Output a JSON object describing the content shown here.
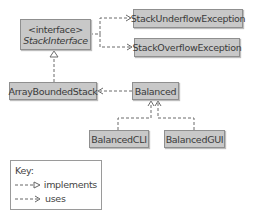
{
  "diagram": {
    "nodes": {
      "stack_interface": {
        "stereotype": "<interface>",
        "name": "StackInterface"
      },
      "stack_underflow": {
        "name": "StackUnderflowException"
      },
      "stack_overflow": {
        "name": "StackOverflowException"
      },
      "array_bounded_stack": {
        "name": "ArrayBoundedStack"
      },
      "balanced": {
        "name": "Balanced"
      },
      "balanced_cli": {
        "name": "BalancedCLI"
      },
      "balanced_gui": {
        "name": "BalancedGUI"
      }
    },
    "edges": [
      {
        "from": "StackInterface",
        "to": "StackUnderflowException",
        "type": "uses"
      },
      {
        "from": "StackInterface",
        "to": "StackOverflowException",
        "type": "uses"
      },
      {
        "from": "ArrayBoundedStack",
        "to": "StackInterface",
        "type": "implements"
      },
      {
        "from": "Balanced",
        "to": "ArrayBoundedStack",
        "type": "uses"
      },
      {
        "from": "BalancedCLI",
        "to": "Balanced",
        "type": "uses"
      },
      {
        "from": "BalancedGUI",
        "to": "Balanced",
        "type": "uses"
      }
    ],
    "colors": {
      "box_fill": "#c8c8c8",
      "box_border": "#8f8f8f",
      "line": "#6a6a6a"
    }
  },
  "key": {
    "title": "Key:",
    "implements_label": "implements",
    "uses_label": "uses"
  }
}
